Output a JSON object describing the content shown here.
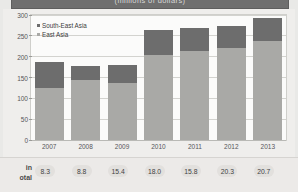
{
  "header": {
    "title": "(millions of dollars)"
  },
  "legend": {
    "items": [
      {
        "label": "South-East Asia",
        "color": "#6d6d6d",
        "key": "south_east_asia"
      },
      {
        "label": "East Asia",
        "color": "#a9a9a6",
        "key": "east_asia"
      }
    ]
  },
  "footer": {
    "label_line1": "in",
    "label_line2": "otal",
    "values": [
      "8.3",
      "8.8",
      "15.4",
      "18.0",
      "15.8",
      "20.3",
      "20.7"
    ]
  },
  "axis": {
    "y_ticks": [
      "300",
      "250",
      "200",
      "150",
      "100",
      "50",
      "0"
    ],
    "x_ticks": [
      "2007",
      "2008",
      "2009",
      "2010",
      "2011",
      "2012",
      "2013"
    ]
  },
  "chart_data": {
    "type": "bar",
    "title": "(millions of dollars)",
    "xlabel": "",
    "ylabel": "",
    "ylim": [
      0,
      300
    ],
    "ytick_step": 50,
    "grid": true,
    "stacked": true,
    "legend_position": "top-left",
    "categories": [
      "2007",
      "2008",
      "2009",
      "2010",
      "2011",
      "2012",
      "2013"
    ],
    "series": [
      {
        "name": "East Asia",
        "color": "#a9a9a6",
        "values": [
          125,
          145,
          137,
          205,
          213,
          222,
          237
        ]
      },
      {
        "name": "South-East Asia",
        "color": "#6d6d6d",
        "values": [
          63,
          32,
          44,
          58,
          55,
          52,
          55
        ]
      }
    ],
    "totals": [
      188,
      177,
      181,
      263,
      268,
      274,
      292
    ],
    "annotations": {
      "label": "in total",
      "values": [
        8.3,
        8.8,
        15.4,
        18.0,
        15.8,
        20.3,
        20.7
      ]
    }
  }
}
